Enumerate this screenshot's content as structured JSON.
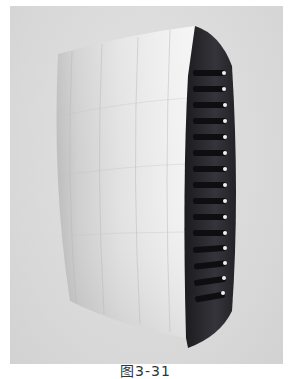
{
  "figure": {
    "caption": "图3-31",
    "colors": {
      "background": "#dcdcdc",
      "front_panel_light": "#f2f2f2",
      "front_panel_shade": "#c8c8c8",
      "side_panel": "#2b2b2e",
      "slot": "#111113",
      "led": "#f5f5f5"
    },
    "slot_count": 15
  }
}
